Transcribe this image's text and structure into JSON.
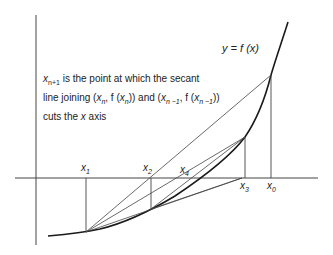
{
  "diagram": {
    "curve_label": "y = f (x)",
    "note": {
      "line1": "x_{n+1} is the point at which the secant",
      "line2": "line joining (x_n, f (x_n)) and (x_{n-1}, f (x_{n-1}))",
      "line3": "cuts the x axis"
    },
    "points": [
      {
        "label": "x0",
        "sub": "0"
      },
      {
        "label": "x1",
        "sub": "1"
      },
      {
        "label": "x2",
        "sub": "2"
      },
      {
        "label": "x3",
        "sub": "3"
      },
      {
        "label": "x4",
        "sub": "4"
      }
    ],
    "colors": {
      "line": "#333333",
      "curve": "#1a1a1a",
      "background": "#ffffff"
    }
  },
  "text": {
    "x": "x",
    "n1": "n+1",
    "is_point": " is the point at which the secant",
    "line_joining": "line joining (",
    "n": "n",
    "comma_f": ", f (",
    "close_and": ")) and (",
    "nm1": "n −1",
    "close": "))",
    "cuts": "cuts the ",
    "axis": " axis",
    "y_eq": "y = f (x)",
    "s0": "0",
    "s1": "1",
    "s2": "2",
    "s3": "3",
    "s4": "4"
  }
}
